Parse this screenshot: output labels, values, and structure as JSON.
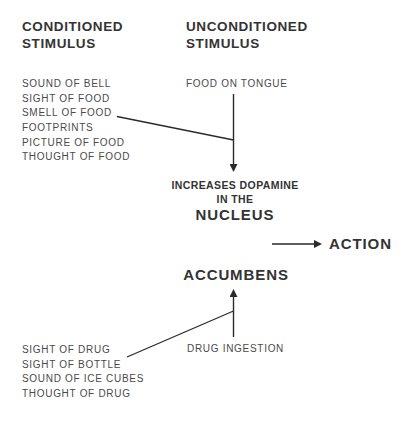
{
  "diagram": {
    "conditioned": {
      "title_line1": "CONDITIONED",
      "title_line2": "STIMULUS",
      "food_cues": [
        "SOUND OF BELL",
        "SIGHT OF FOOD",
        "SMELL OF FOOD",
        "FOOTPRINTS",
        "PICTURE OF FOOD",
        "THOUGHT OF FOOD"
      ],
      "drug_cues": [
        "SIGHT OF DRUG",
        "SIGHT OF BOTTLE",
        "SOUND OF ICE CUBES",
        "THOUGHT OF DRUG"
      ]
    },
    "unconditioned": {
      "title_line1": "UNCONDITIONED",
      "title_line2": "STIMULUS",
      "food": "FOOD ON TONGUE",
      "drug": "DRUG INGESTION"
    },
    "center": {
      "line1": "INCREASES DOPAMINE",
      "line2": "IN THE",
      "line3": "NUCLEUS",
      "line4": "ACCUMBENS"
    },
    "outcome": {
      "label": "ACTION"
    },
    "colors": {
      "text": "#333333",
      "list_text": "#4a4a4a",
      "line": "#2a2a2a",
      "background": "#ffffff"
    }
  }
}
